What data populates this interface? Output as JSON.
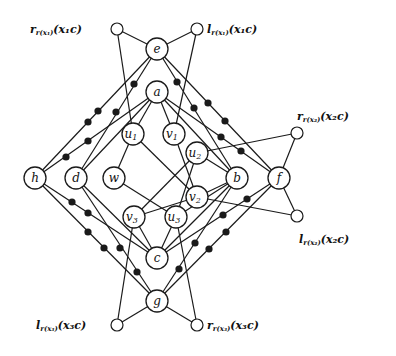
{
  "diagram": {
    "type": "graph",
    "nodes": [
      {
        "id": "e",
        "label": "e",
        "sub": "",
        "x": 157,
        "y": 49
      },
      {
        "id": "a",
        "label": "a",
        "sub": "",
        "x": 157,
        "y": 92
      },
      {
        "id": "u1",
        "label": "u",
        "sub": "1",
        "x": 133,
        "y": 134
      },
      {
        "id": "v1",
        "label": "v",
        "sub": "1",
        "x": 174,
        "y": 134
      },
      {
        "id": "u2",
        "label": "u",
        "sub": "2",
        "x": 197,
        "y": 153
      },
      {
        "id": "h",
        "label": "h",
        "sub": "",
        "x": 35,
        "y": 178
      },
      {
        "id": "d",
        "label": "d",
        "sub": "",
        "x": 76,
        "y": 178
      },
      {
        "id": "w",
        "label": "w",
        "sub": "",
        "x": 114,
        "y": 178
      },
      {
        "id": "b",
        "label": "b",
        "sub": "",
        "x": 237,
        "y": 178
      },
      {
        "id": "f",
        "label": "f",
        "sub": "",
        "x": 279,
        "y": 178
      },
      {
        "id": "v2",
        "label": "v",
        "sub": "2",
        "x": 197,
        "y": 197
      },
      {
        "id": "v3",
        "label": "v",
        "sub": "3",
        "x": 134,
        "y": 217
      },
      {
        "id": "u3",
        "label": "u",
        "sub": "3",
        "x": 176,
        "y": 217
      },
      {
        "id": "c",
        "label": "c",
        "sub": "",
        "x": 157,
        "y": 258
      },
      {
        "id": "g",
        "label": "g",
        "sub": "",
        "x": 157,
        "y": 301
      }
    ],
    "terminals": [
      {
        "id": "t1",
        "x": 117,
        "y": 29,
        "text": "r",
        "sub": "r(x₁)",
        "arg": "(x₁c)",
        "lx": 30,
        "ly": 33
      },
      {
        "id": "t2",
        "x": 197,
        "y": 29,
        "text": "l",
        "sub": "r(x₁)",
        "arg": "(x₁c)",
        "lx": 207,
        "ly": 33
      },
      {
        "id": "t3",
        "x": 297,
        "y": 133,
        "text": "r",
        "sub": "r(x₂)",
        "arg": "(x₂c)",
        "lx": 297,
        "ly": 120
      },
      {
        "id": "t4",
        "x": 297,
        "y": 216,
        "text": "l",
        "sub": "r(x₂)",
        "arg": "(x₂c)",
        "lx": 299,
        "ly": 243
      },
      {
        "id": "t5",
        "x": 117,
        "y": 325,
        "text": "l",
        "sub": "r(x₃)",
        "arg": "(x₃c)",
        "lx": 36,
        "ly": 329
      },
      {
        "id": "t6",
        "x": 197,
        "y": 325,
        "text": "r",
        "sub": "r(x₃)",
        "arg": "(x₃c)",
        "lx": 207,
        "ly": 329
      }
    ],
    "edges": [
      [
        "t1",
        "e"
      ],
      [
        "t2",
        "e"
      ],
      [
        "t1",
        "u1"
      ],
      [
        "t2",
        "v1"
      ],
      [
        "t3",
        "f"
      ],
      [
        "t4",
        "f"
      ],
      [
        "t3",
        "u2"
      ],
      [
        "t4",
        "v2"
      ],
      [
        "t5",
        "g"
      ],
      [
        "t6",
        "g"
      ],
      [
        "t5",
        "v3"
      ],
      [
        "t6",
        "u3"
      ],
      [
        "e",
        "h"
      ],
      [
        "e",
        "d"
      ],
      [
        "e",
        "b"
      ],
      [
        "e",
        "f"
      ],
      [
        "a",
        "h"
      ],
      [
        "a",
        "d"
      ],
      [
        "a",
        "b"
      ],
      [
        "a",
        "f"
      ],
      [
        "a",
        "u1"
      ],
      [
        "a",
        "v1"
      ],
      [
        "h",
        "c"
      ],
      [
        "h",
        "g"
      ],
      [
        "d",
        "c"
      ],
      [
        "d",
        "g"
      ],
      [
        "b",
        "c"
      ],
      [
        "b",
        "g"
      ],
      [
        "f",
        "c"
      ],
      [
        "f",
        "g"
      ],
      [
        "c",
        "v3"
      ],
      [
        "c",
        "u3"
      ],
      [
        "u1",
        "w"
      ],
      [
        "u1",
        "v2"
      ],
      [
        "w",
        "u3"
      ],
      [
        "v1",
        "v2"
      ],
      [
        "u2",
        "v3"
      ],
      [
        "u2",
        "u3"
      ],
      [
        "u2",
        "b"
      ],
      [
        "v2",
        "b"
      ],
      [
        "v2",
        "v3"
      ],
      [
        "u3",
        "b"
      ]
    ],
    "dotted_edges": [
      {
        "from": "e",
        "to": "h",
        "dots": [
          [
            98,
            111
          ],
          [
            88,
            122
          ]
        ]
      },
      {
        "from": "e",
        "to": "d",
        "dots": [
          [
            134,
            84
          ],
          [
            116,
            112
          ]
        ]
      },
      {
        "from": "a",
        "to": "h",
        "dots": [
          [
            88,
            141
          ],
          [
            66,
            157
          ]
        ]
      },
      {
        "from": "e",
        "to": "b",
        "dots": [
          [
            177,
            82
          ],
          [
            194,
            108
          ]
        ]
      },
      {
        "from": "e",
        "to": "f",
        "dots": [
          [
            208,
            103
          ],
          [
            225,
            121
          ]
        ]
      },
      {
        "from": "a",
        "to": "f",
        "dots": [
          [
            221,
            137
          ],
          [
            241,
            151
          ]
        ]
      },
      {
        "from": "h",
        "to": "c",
        "dots": [
          [
            72,
            202
          ],
          [
            88,
            213
          ]
        ]
      },
      {
        "from": "h",
        "to": "g",
        "dots": [
          [
            88,
            232
          ],
          [
            104,
            248
          ]
        ]
      },
      {
        "from": "d",
        "to": "g",
        "dots": [
          [
            120,
            248
          ],
          [
            137,
            272
          ]
        ]
      },
      {
        "from": "f",
        "to": "c",
        "dots": [
          [
            247,
            199
          ],
          [
            223,
            215
          ]
        ]
      },
      {
        "from": "f",
        "to": "g",
        "dots": [
          [
            226,
            232
          ],
          [
            209,
            249
          ]
        ]
      },
      {
        "from": "b",
        "to": "g",
        "dots": [
          [
            195,
            243
          ],
          [
            179,
            269
          ]
        ]
      }
    ]
  }
}
